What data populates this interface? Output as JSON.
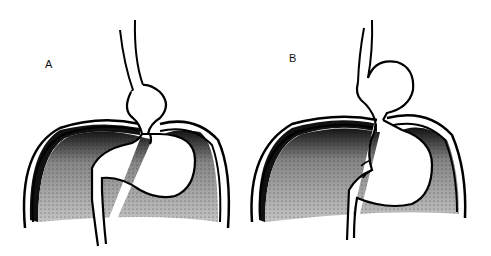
{
  "figure": {
    "panels": [
      {
        "id": "A",
        "label": "A",
        "description": "Sliding hiatal hernia: gastroesophageal junction and stomach portion displaced above the diaphragm"
      },
      {
        "id": "B",
        "label": "B",
        "description": "Paraesophageal hiatal hernia: fundus herniated above the diaphragm beside the esophagus"
      }
    ],
    "colors": {
      "outline": "#000000",
      "shading_dark": "#1a1a1a",
      "shading_light": "#bdbdbd",
      "background": "#ffffff"
    }
  }
}
